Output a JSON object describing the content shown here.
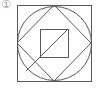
{
  "figure": {
    "label": "①",
    "stroke_color": "#5a5a5a",
    "label_color": "#9a9a9a",
    "shapes": {
      "outer_square": {
        "x": 17,
        "y": 5,
        "width": 74,
        "height": 76
      },
      "circle": {
        "cx": 54,
        "cy": 43,
        "r": 37
      },
      "diamond": {
        "points": "54,5 91,43 54,81 17,43"
      },
      "inner_square": {
        "x": 40,
        "y": 29,
        "width": 28,
        "height": 28
      },
      "diagonal": {
        "x1": 68,
        "y1": 29,
        "x2": 26,
        "y2": 71
      }
    }
  }
}
